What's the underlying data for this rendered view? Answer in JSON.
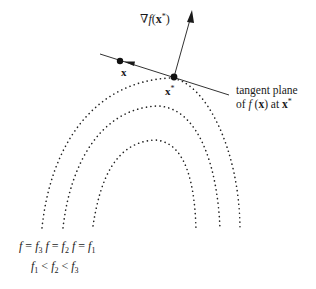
{
  "diagram": {
    "gradient_label": {
      "nabla": "∇",
      "f": "f",
      "open": "(",
      "x": "x",
      "star": "*",
      "close": ")"
    },
    "point_x_label": "x",
    "point_xstar_label": {
      "x": "x",
      "star": "*"
    },
    "tangent_label": {
      "line1": "tangent plane",
      "line2_of": "of ",
      "line2_f": "f",
      "line2_open": " (",
      "line2_x": "x",
      "line2_close": ")",
      "line2_at": " at ",
      "line2_xs": "x",
      "line2_star": "*"
    },
    "contour_labels": [
      {
        "f": "f",
        "eq": " = ",
        "fi": "f",
        "sub": "3"
      },
      {
        "f": "f",
        "eq": " = ",
        "fi": "f",
        "sub": "2"
      },
      {
        "f": "f",
        "eq": " = ",
        "fi": "f",
        "sub": "1"
      }
    ],
    "ordering": {
      "f1": "f",
      "s1": "1",
      "lt1": " < ",
      "f2": "f",
      "s2": "2",
      "lt2": " < ",
      "f3": "f",
      "s3": "3"
    },
    "colors": {
      "ink": "#1a1a1a",
      "background": "#ffffff"
    }
  }
}
